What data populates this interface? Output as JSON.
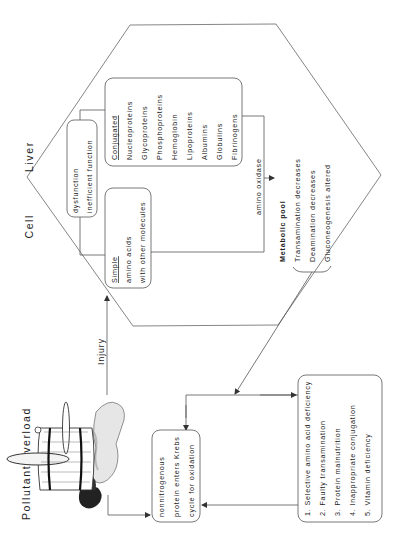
{
  "diagram": {
    "orientation": "rotated-90-ccw",
    "hexagon_label": {
      "word1": "Liver",
      "word2": "Cell"
    },
    "source": {
      "title": "Pollutant overload",
      "icon": "leaking-barrel"
    },
    "edges": {
      "injury": "Injury",
      "amino_oxidase": "amino oxidase"
    },
    "boxes": {
      "dysfunction": {
        "lines": [
          "dysfunction",
          "inefficient function"
        ]
      },
      "simple": {
        "heading": "Simple",
        "lines": [
          "amino acids",
          "with other molecules"
        ]
      },
      "conjugated": {
        "heading": "Conjugated",
        "items": [
          "Nucleoproteins",
          "Glycoproteins",
          "Phosphoproteins",
          "Hemoglobin",
          "Lipoproteins",
          "Albumins",
          "Globulins",
          "Fibrinogens"
        ]
      },
      "metabolic_pool": {
        "heading": "Metabolic pool",
        "items": [
          "Transamination decreases",
          "Deamination decreases",
          "Gluconeogenesis altered"
        ]
      },
      "krebs": {
        "lines": [
          "nonnitrogenous",
          "protein enters Krebs",
          "cycle for oxidation"
        ]
      },
      "deficiencies": {
        "items": [
          "1.  Selective amino acid deficiency",
          "2.  Faulty transamination",
          "3.  Protein malnutrition",
          "4.  Inappropriate conjugation",
          "5.  Vitamin deficiency"
        ]
      }
    }
  }
}
